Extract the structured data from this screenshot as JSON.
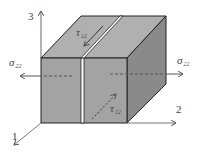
{
  "diagram": {
    "axes": {
      "axis_1": "1",
      "axis_2": "2",
      "axis_3": "3"
    },
    "stresses": {
      "sigma_left": {
        "symbol": "σ",
        "subscript": "22"
      },
      "sigma_right": {
        "symbol": "σ",
        "subscript": "22"
      },
      "tau_top": {
        "symbol": "τ",
        "subscript": "12"
      },
      "tau_front": {
        "symbol": "τ",
        "subscript": "12"
      }
    },
    "colors": {
      "front_face": "#a3a3a3",
      "top_face": "#b0b0b0",
      "side_face": "#8a8a8a",
      "edge": "#222222",
      "arrow": "#555555",
      "gap": "#ffffff"
    }
  }
}
